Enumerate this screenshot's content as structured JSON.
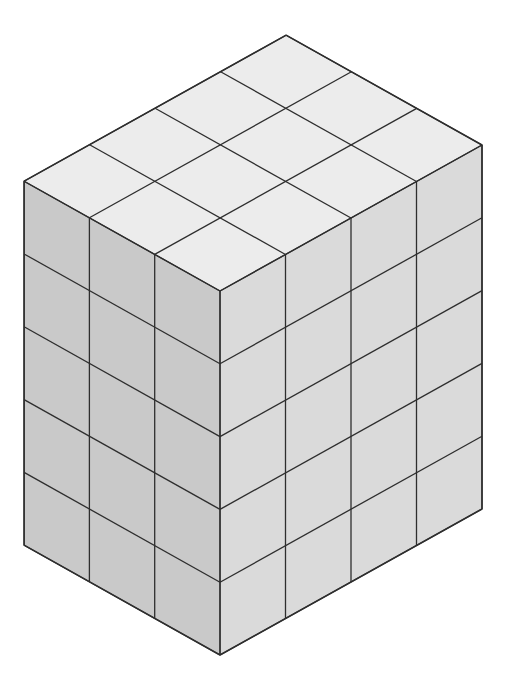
{
  "diagram": {
    "dimensions": {
      "left_cubes": 3,
      "right_cubes": 4,
      "layers": 5
    },
    "geometry": {
      "front_corner_top": [
        220,
        291
      ],
      "unit_left": [
        -65.3,
        -36.6
      ],
      "unit_right": [
        65.5,
        -36.5
      ],
      "unit_height": 72.8
    },
    "colors": {
      "top_face": "#ececec",
      "left_face": "#c9c9c9",
      "right_face": "#dadada",
      "edge": "#2e2e2e",
      "background": "#ffffff"
    }
  }
}
